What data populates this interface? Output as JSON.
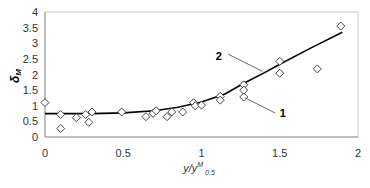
{
  "chart_data": {
    "type": "scatter",
    "title": "",
    "xlabel": "y/y^M_0.5",
    "xlabel_parts": {
      "main": "y/y",
      "sup": "M",
      "sub": "0.5"
    },
    "ylabel": "δM",
    "ylabel_parts": {
      "main": "δ",
      "sub": "M"
    },
    "xlim": [
      0,
      2
    ],
    "ylim": [
      0,
      4
    ],
    "xticks": [
      "0",
      "0.5",
      "1",
      "1.5",
      "2"
    ],
    "yticks": [
      "0",
      "0.5",
      "1",
      "1.5",
      "2",
      "2.5",
      "3",
      "3.5",
      "4"
    ],
    "grid": false,
    "legend": "none",
    "series": [
      {
        "name": "1",
        "kind": "points",
        "marker": "diamond-open",
        "points": [
          [
            0.0,
            1.1
          ],
          [
            0.1,
            0.72
          ],
          [
            0.1,
            0.27
          ],
          [
            0.2,
            0.62
          ],
          [
            0.26,
            0.72
          ],
          [
            0.28,
            0.47
          ],
          [
            0.3,
            0.8
          ],
          [
            0.49,
            0.8
          ],
          [
            0.645,
            0.65
          ],
          [
            0.69,
            0.76
          ],
          [
            0.71,
            0.84
          ],
          [
            0.78,
            0.65
          ],
          [
            0.81,
            0.8
          ],
          [
            0.88,
            0.8
          ],
          [
            0.95,
            1.1
          ],
          [
            0.96,
            1.0
          ],
          [
            1.0,
            1.02
          ],
          [
            1.12,
            1.3
          ],
          [
            1.12,
            1.18
          ],
          [
            1.27,
            1.67
          ],
          [
            1.27,
            1.5
          ],
          [
            1.27,
            1.28
          ],
          [
            1.5,
            2.42
          ],
          [
            1.5,
            2.04
          ],
          [
            1.74,
            2.18
          ],
          [
            1.89,
            3.55
          ]
        ]
      },
      {
        "name": "2",
        "kind": "line",
        "points": [
          [
            0.0,
            0.75
          ],
          [
            0.3,
            0.75
          ],
          [
            0.5,
            0.77
          ],
          [
            0.7,
            0.84
          ],
          [
            0.85,
            0.95
          ],
          [
            1.0,
            1.12
          ],
          [
            1.15,
            1.38
          ],
          [
            1.27,
            1.72
          ],
          [
            1.4,
            2.05
          ],
          [
            1.5,
            2.33
          ],
          [
            1.7,
            2.85
          ],
          [
            1.9,
            3.35
          ]
        ]
      }
    ],
    "annotations": [
      {
        "text": "1",
        "label_at": [
          1.52,
          0.77
        ],
        "line_from": [
          1.28,
          1.25
        ],
        "line_to": [
          1.47,
          0.77
        ]
      },
      {
        "text": "2",
        "label_at": [
          1.11,
          2.6
        ],
        "line_from": [
          1.17,
          2.65
        ],
        "line_to": [
          1.39,
          2.1
        ]
      }
    ]
  }
}
